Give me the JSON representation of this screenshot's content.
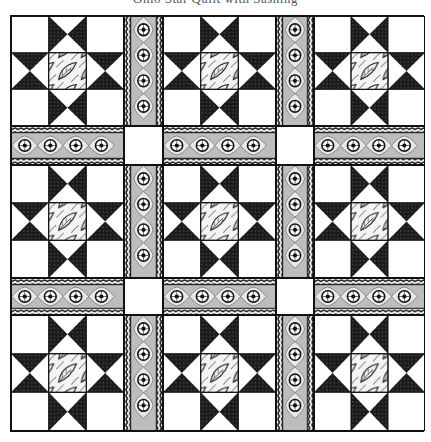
{
  "title": "Ohio Star Quilt with Sashing",
  "quilt": {
    "rows": 3,
    "columns": 3,
    "block_type": "ohio-star",
    "block_count": 9,
    "sashing": "border-print-with-rope-edges",
    "cornerstones": 4,
    "colors": {
      "dark": "#1a1a1a",
      "light": "#ffffff",
      "outline": "#111111",
      "print_mid": "#9a9a9a"
    },
    "center_fabric": "leaf-print",
    "sashing_motif": "medallion-rosette"
  },
  "blocks": [
    {
      "row": 1,
      "col": 1,
      "label": "Ohio Star block"
    },
    {
      "row": 1,
      "col": 2,
      "label": "Ohio Star block"
    },
    {
      "row": 1,
      "col": 3,
      "label": "Ohio Star block"
    },
    {
      "row": 2,
      "col": 1,
      "label": "Ohio Star block"
    },
    {
      "row": 2,
      "col": 2,
      "label": "Ohio Star block"
    },
    {
      "row": 2,
      "col": 3,
      "label": "Ohio Star block"
    },
    {
      "row": 3,
      "col": 1,
      "label": "Ohio Star block"
    },
    {
      "row": 3,
      "col": 2,
      "label": "Ohio Star block"
    },
    {
      "row": 3,
      "col": 3,
      "label": "Ohio Star block"
    }
  ]
}
